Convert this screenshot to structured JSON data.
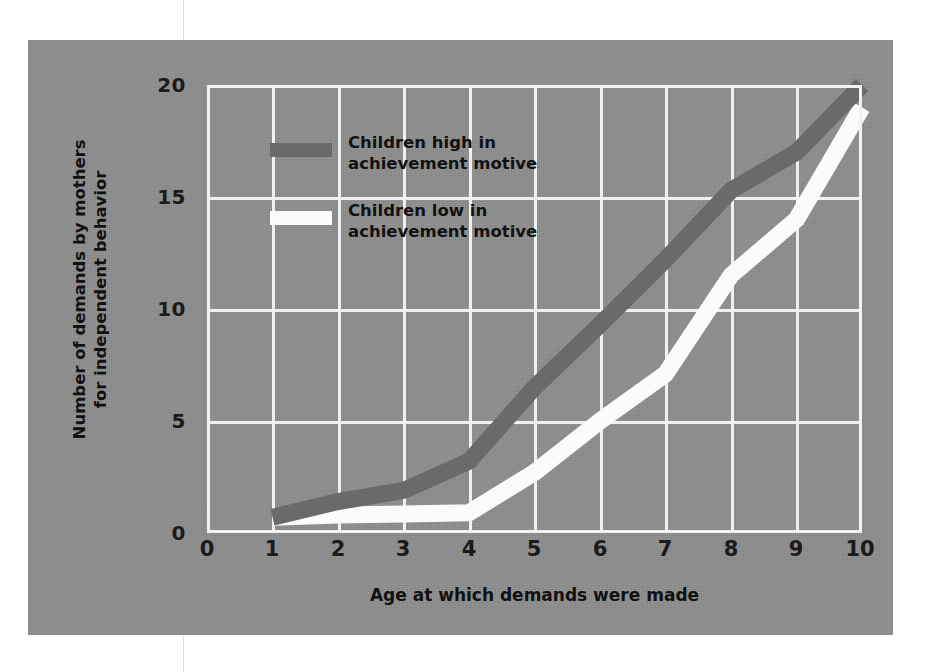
{
  "chart_data": {
    "type": "line",
    "title": "",
    "xlabel": "Age at which demands were made",
    "ylabel": "Number of demands by mothers for independent behavior",
    "ylabel_line1": "Number of demands by mothers",
    "ylabel_line2": "for independent behavior",
    "xlim": [
      0,
      10
    ],
    "ylim": [
      0,
      20
    ],
    "xticks": [
      "0",
      "1",
      "2",
      "3",
      "4",
      "5",
      "6",
      "7",
      "8",
      "9",
      "10"
    ],
    "yticks": [
      "0",
      "5",
      "10",
      "15",
      "20"
    ],
    "grid": true,
    "legend_position": "upper-left-inside",
    "x": [
      1,
      2,
      3,
      4,
      5,
      6,
      7,
      8,
      9,
      10
    ],
    "series": [
      {
        "name": "Children high in achievement motive",
        "label_line1": "Children high in",
        "label_line2": "achievement motive",
        "color": "#6a6a6a",
        "values": [
          0.7,
          1.4,
          1.9,
          3.2,
          6.5,
          9.3,
          12.2,
          15.3,
          17.0,
          20.0
        ]
      },
      {
        "name": "Children low in achievement motive",
        "label_line1": "Children low in",
        "label_line2": "achievement motive",
        "color": "#fbfbfb",
        "values": [
          0.7,
          0.8,
          0.85,
          0.9,
          2.7,
          5.0,
          7.1,
          11.5,
          14.0,
          19.0
        ]
      }
    ]
  },
  "colors": {
    "panel_background": "#8e8e8e",
    "gridlines": "#f0f0f0",
    "text": "#111111",
    "high_series": "#6a6a6a",
    "low_series": "#fbfbfb"
  }
}
